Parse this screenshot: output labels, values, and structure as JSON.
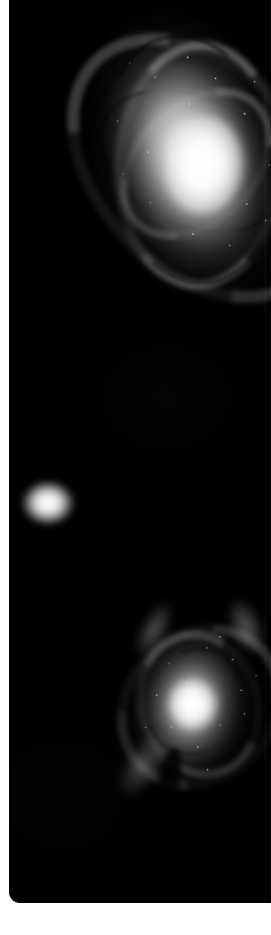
{
  "panel": {
    "kind": "astronomical-image-crop",
    "background_color": "#000000",
    "page_background_color": "#ffffff",
    "width_px": 271,
    "height_px": 935,
    "sky_panel": {
      "left_px": 9,
      "top_px": 0,
      "width_px": 262,
      "height_px": 903,
      "corner_radius_bottom_left_px": 11
    },
    "margins": {
      "left_px": 9,
      "bottom_px": 32,
      "color": "#ffffff"
    }
  },
  "objects": [
    {
      "id": "galaxy-upper",
      "type": "spiral-galaxy",
      "description": "Large bright barred spiral galaxy, clipped by the right edge of the crop",
      "center_px": {
        "x": 187,
        "y": 163
      },
      "approx_size_px": {
        "w": 230,
        "h": 350
      },
      "rotation_deg": -16,
      "peak_brightness": "#ffffff",
      "halo_color": "#b4b4b4",
      "features": [
        "bright core",
        "spiral arms",
        "dark dust lanes",
        "bright knots"
      ]
    },
    {
      "id": "companion-elliptical",
      "type": "elliptical-companion",
      "description": "Small smooth fuzzy elliptical blob on the left, no internal structure",
      "center_px": {
        "x": 48,
        "y": 503
      },
      "approx_size_px": {
        "w": 52,
        "h": 44
      },
      "rotation_deg": 0,
      "peak_brightness": "#ffffff",
      "halo_color": "#e4e4e4",
      "features": [
        "smooth profile",
        "soft edges"
      ]
    },
    {
      "id": "galaxy-lower",
      "type": "spiral-galaxy",
      "description": "Smaller spiral galaxy with a very bright compact nucleus and faint tidal plumes",
      "center_px": {
        "x": 192,
        "y": 696
      },
      "approx_size_px": {
        "w": 160,
        "h": 208
      },
      "rotation_deg": 8,
      "peak_brightness": "#ffffff",
      "halo_color": "#8c8c8c",
      "features": [
        "bright nucleus",
        "spiral arms",
        "tidal tails",
        "dust wedge"
      ]
    }
  ],
  "accents": {
    "sky": "#000000",
    "star_white": "#ffffff",
    "halo_gray": "#9a9a9a",
    "page_white": "#ffffff",
    "seam_line": "rgba(255,255,255,0.05)"
  }
}
